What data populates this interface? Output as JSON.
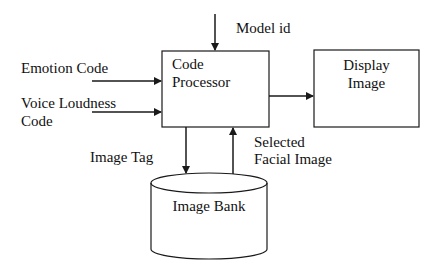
{
  "diagram": {
    "nodes": {
      "code_processor": {
        "line1": "Code",
        "line2": "Processor"
      },
      "display_image": {
        "line1": "Display",
        "line2": "Image"
      },
      "image_bank": {
        "label": "Image Bank"
      }
    },
    "inputs": {
      "model_id": "Model id",
      "emotion_code": "Emotion Code",
      "voice_loudness_line1": "Voice Loudness",
      "voice_loudness_line2": "Code"
    },
    "edges": {
      "image_tag": "Image Tag",
      "selected_line1": "Selected",
      "selected_line2": "Facial Image"
    },
    "colors": {
      "stroke": "#1a1a1a",
      "background": "#ffffff"
    }
  }
}
